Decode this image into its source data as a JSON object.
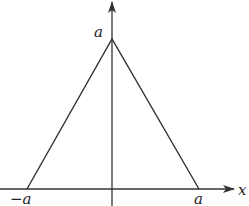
{
  "diagram": {
    "type": "triangle-function-graph",
    "labels": {
      "apex_y": "a",
      "left_x": "−a",
      "right_x": "a",
      "x_axis": "x"
    },
    "colors": {
      "line": "#333333",
      "background": "#ffffff"
    }
  }
}
